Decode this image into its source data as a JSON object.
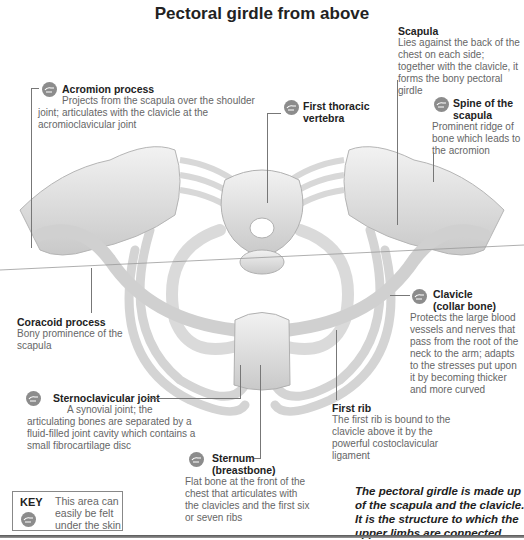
{
  "title": "Pectoral girdle from above",
  "labels": {
    "acromion": {
      "heading": "Acromion process",
      "text": "Projects from the scapula over the shoulder joint; articulates with the clavicle at the acromioclavicular joint",
      "palpable": true
    },
    "scapula": {
      "heading": "Scapula",
      "text": "Lies against the back of the chest on each side; together with the clavicle, it forms the bony pectoral girdle",
      "palpable": false
    },
    "spine_of_scapula": {
      "heading_line1": "Spine of the",
      "heading_line2": "scapula",
      "text": "Prominent ridge of bone which leads to the acromion",
      "palpable": true
    },
    "first_thoracic_vertebra": {
      "heading_line1": "First thoracic",
      "heading_line2": "vertebra",
      "palpable": true
    },
    "coracoid": {
      "heading": "Coracoid process",
      "text": "Bony prominence of the scapula",
      "palpable": false
    },
    "clavicle": {
      "heading_line1": "Clavicle",
      "heading_line2": "(collar bone)",
      "text": "Protects the large blood vessels and nerves that pass from the root of the neck to the arm; adapts to the stresses put upon it by becoming thicker and more curved",
      "palpable": true
    },
    "sternoclavicular": {
      "heading": "Sternoclavicular joint",
      "text_line1": "A synovial joint; the",
      "text_rest": "articulating bones are separated by a fluid-filled joint cavity which contains a small fibrocartilage disc",
      "palpable": true
    },
    "first_rib": {
      "heading": "First rib",
      "text": "The first rib is bound to the clavicle above it by the powerful costoclavicular ligament",
      "palpable": false
    },
    "sternum": {
      "heading_line1": "Sternum",
      "heading_line2": "(breastbone)",
      "text": "Flat bone at the front of the chest that articulates with the clavicles and the first six or seven ribs",
      "palpable": true
    }
  },
  "key": {
    "title": "KEY",
    "description": "This area can easily be felt under the skin",
    "icon": "hand-palpate-icon"
  },
  "summary": "The pectoral girdle is made up of the scapula and the clavicle. It is the structure to which the upper limbs are connected.",
  "colors": {
    "bone": "#e6e6e6",
    "bone_shadow": "#bdbdbd",
    "icon": "#8c8c8c",
    "heading": "#222222",
    "body_text": "#666666"
  }
}
